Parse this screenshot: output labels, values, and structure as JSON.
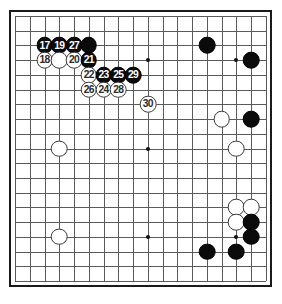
{
  "diagram": {
    "kind": "go-board-diagram",
    "board_size": 19,
    "visible_columns": 18,
    "visible_rows": 19,
    "grid_spacing_px": 14.5,
    "colors": {
      "board_background": "#ffffff",
      "grid_line": "#5a5a5a",
      "border": "#1a1a1a",
      "black_stone": "#0b0b0b",
      "white_stone": "#ffffff",
      "white_stone_outline": "#3a3a3a",
      "black_label_text": "#ffffff",
      "white_label_text": "#2a2a2a",
      "star_point": "#111111"
    },
    "star_points": [
      {
        "col": 3,
        "row": 3
      },
      {
        "col": 9,
        "row": 3
      },
      {
        "col": 15,
        "row": 3
      },
      {
        "col": 3,
        "row": 9
      },
      {
        "col": 9,
        "row": 9
      },
      {
        "col": 15,
        "row": 9
      },
      {
        "col": 3,
        "row": 15
      },
      {
        "col": 9,
        "row": 15
      },
      {
        "col": 15,
        "row": 15
      }
    ],
    "stones": [
      {
        "col": 2,
        "row": 2,
        "color": "black",
        "label": "17"
      },
      {
        "col": 3,
        "row": 2,
        "color": "black",
        "label": "19"
      },
      {
        "col": 4,
        "row": 2,
        "color": "black",
        "label": "27"
      },
      {
        "col": 5,
        "row": 2,
        "color": "black",
        "label": ""
      },
      {
        "col": 2,
        "row": 3,
        "color": "white",
        "label": "18"
      },
      {
        "col": 3,
        "row": 3,
        "color": "white",
        "label": ""
      },
      {
        "col": 4,
        "row": 3,
        "color": "white",
        "label": "20"
      },
      {
        "col": 5,
        "row": 3,
        "color": "black",
        "label": "21"
      },
      {
        "col": 5,
        "row": 4,
        "color": "white",
        "label": "22"
      },
      {
        "col": 6,
        "row": 4,
        "color": "black",
        "label": "23"
      },
      {
        "col": 7,
        "row": 4,
        "color": "black",
        "label": "25"
      },
      {
        "col": 8,
        "row": 4,
        "color": "black",
        "label": "29"
      },
      {
        "col": 5,
        "row": 5,
        "color": "white",
        "label": "26"
      },
      {
        "col": 6,
        "row": 5,
        "color": "white",
        "label": "24"
      },
      {
        "col": 7,
        "row": 5,
        "color": "white",
        "label": "28"
      },
      {
        "col": 9,
        "row": 6,
        "color": "white",
        "label": "30"
      },
      {
        "col": 13,
        "row": 2,
        "color": "black",
        "label": ""
      },
      {
        "col": 16,
        "row": 3,
        "color": "black",
        "label": ""
      },
      {
        "col": 14,
        "row": 7,
        "color": "white",
        "label": ""
      },
      {
        "col": 16,
        "row": 7,
        "color": "black",
        "label": ""
      },
      {
        "col": 15,
        "row": 9,
        "color": "white",
        "label": ""
      },
      {
        "col": 3,
        "row": 9,
        "color": "white",
        "label": ""
      },
      {
        "col": 3,
        "row": 15,
        "color": "white",
        "label": ""
      },
      {
        "col": 15,
        "row": 13,
        "color": "white",
        "label": ""
      },
      {
        "col": 16,
        "row": 13,
        "color": "white",
        "label": ""
      },
      {
        "col": 15,
        "row": 14,
        "color": "white",
        "label": ""
      },
      {
        "col": 16,
        "row": 14,
        "color": "black",
        "label": ""
      },
      {
        "col": 16,
        "row": 15,
        "color": "black",
        "label": ""
      },
      {
        "col": 13,
        "row": 16,
        "color": "black",
        "label": ""
      },
      {
        "col": 15,
        "row": 16,
        "color": "black",
        "label": ""
      }
    ]
  }
}
